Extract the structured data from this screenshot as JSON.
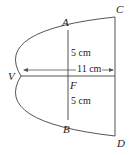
{
  "diagram": {
    "type": "parabolic reflector cross-section",
    "points": {
      "V": "V",
      "A": "A",
      "B": "B",
      "C": "C",
      "D": "D",
      "F": "F"
    },
    "measurements": {
      "upper_half": "5 cm",
      "lower_half": "5 cm",
      "depth": "11 cm"
    },
    "colors": {
      "stroke": "#555555",
      "text": "#222222",
      "background": "#ffffff"
    }
  }
}
